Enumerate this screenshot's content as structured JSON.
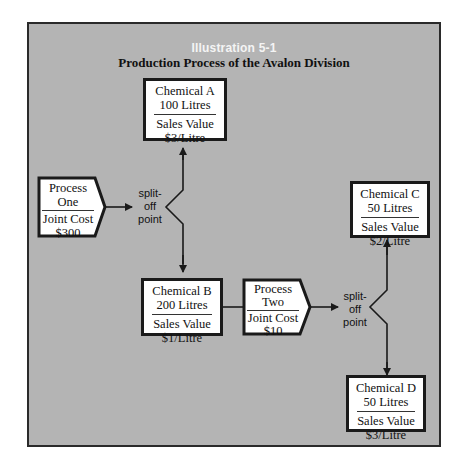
{
  "diagram": {
    "title": "Illustration 5-1",
    "subtitle": "Production Process of the Avalon Division",
    "nodes": {
      "process_one": {
        "line1": "Process",
        "line2": "One",
        "line3": "Joint Cost",
        "line4": "$300"
      },
      "chemical_a": {
        "line1": "Chemical A",
        "line2": "100 Litres",
        "line3": "Sales Value",
        "line4": "$3/Litre"
      },
      "chemical_b": {
        "line1": "Chemical B",
        "line2": "200 Litres",
        "line3": "Sales Value",
        "line4": "$1/Litre"
      },
      "process_two": {
        "line1": "Process",
        "line2": "Two",
        "line3": "Joint Cost",
        "line4": "$10"
      },
      "chemical_c": {
        "line1": "Chemical C",
        "line2": "50 Litres",
        "line3": "Sales Value",
        "line4": "$2/Litre"
      },
      "chemical_d": {
        "line1": "Chemical D",
        "line2": "50 Litres",
        "line3": "Sales Value",
        "line4": "$3/Litre"
      }
    },
    "split_points": [
      {
        "line1": "split-",
        "line2": "off",
        "line3": "point"
      },
      {
        "line1": "split-",
        "line2": "off",
        "line3": "point"
      }
    ],
    "colors": {
      "background": "#b4b4b4",
      "box_fill": "#ffffff",
      "stroke": "#1a1a1a",
      "title": "#f4f4f4"
    }
  }
}
